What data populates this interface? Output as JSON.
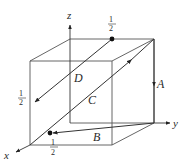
{
  "diagram": {
    "type": "3d-cube-vectors",
    "axes": {
      "x": {
        "label": "x"
      },
      "y": {
        "label": "y"
      },
      "z": {
        "label": "z"
      }
    },
    "vectors": [
      {
        "name": "A",
        "label": "A"
      },
      {
        "name": "B",
        "label": "B"
      },
      {
        "name": "C",
        "label": "C"
      },
      {
        "name": "D",
        "label": "D"
      }
    ],
    "fraction_labels": {
      "top": {
        "num": "1",
        "den": "2"
      },
      "left": {
        "num": "1",
        "den": "2"
      },
      "bottom": {
        "num": "1",
        "den": "2"
      }
    },
    "colors": {
      "cube_edges": "#555555",
      "vectors": "#333333",
      "dots": "#111111"
    }
  }
}
